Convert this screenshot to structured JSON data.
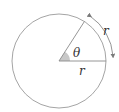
{
  "diagram": {
    "labels": {
      "angle": "θ",
      "radius": "r",
      "arc": "r"
    },
    "colors": {
      "circle": "#9a9a9a",
      "lines": "#8a8a8a",
      "angle_fill": "#c8c8c8",
      "text": "#333333",
      "arrow": "#7a7a7a"
    },
    "geometry": {
      "center": [
        59,
        61
      ],
      "radius": 47,
      "angle_degrees": 57.3
    }
  }
}
